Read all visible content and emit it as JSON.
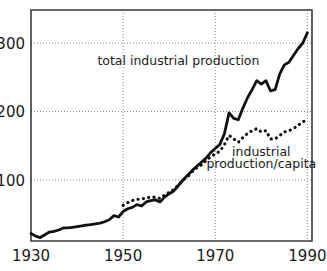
{
  "chart_data": {
    "type": "line",
    "title": "",
    "subtitle": "",
    "xlabel": "",
    "ylabel": "",
    "xlim": [
      1930,
      1991
    ],
    "ylim": [
      0,
      330
    ],
    "grid": true,
    "grid_style": "dotted",
    "legend": "inline-annotations",
    "legend_position": "in-plot",
    "x_ticks": [
      "1930",
      "1950",
      "1970",
      "1990"
    ],
    "x_tick_values": [
      1930,
      1950,
      1970,
      1990
    ],
    "y_ticks": [
      "100",
      "200",
      "300"
    ],
    "y_tick_values": [
      100,
      200,
      300
    ],
    "annotations": [
      {
        "id": "total-label",
        "text": "total industrial production",
        "x": 1962,
        "y": 268
      },
      {
        "id": "percapita-label-line1",
        "text": "industrial",
        "x": 1980,
        "y": 135
      },
      {
        "id": "percapita-label-line2",
        "text": "production/capita",
        "x": 1980,
        "y": 117
      }
    ],
    "series": [
      {
        "name": "total industrial production",
        "style": "solid",
        "x": [
          1930,
          1931,
          1932,
          1933,
          1934,
          1935,
          1936,
          1937,
          1938,
          1939,
          1940,
          1941,
          1942,
          1943,
          1944,
          1945,
          1946,
          1947,
          1948,
          1949,
          1950,
          1951,
          1952,
          1953,
          1954,
          1955,
          1956,
          1957,
          1958,
          1959,
          1960,
          1961,
          1962,
          1963,
          1964,
          1965,
          1966,
          1967,
          1968,
          1969,
          1970,
          1971,
          1972,
          1973,
          1974,
          1975,
          1976,
          1977,
          1978,
          1979,
          1980,
          1981,
          1982,
          1983,
          1984,
          1985,
          1986,
          1987,
          1988,
          1989,
          1990
        ],
        "values": [
          22,
          18,
          16,
          20,
          24,
          25,
          27,
          30,
          30,
          31,
          32,
          33,
          34,
          35,
          36,
          37,
          39,
          42,
          48,
          46,
          54,
          58,
          60,
          64,
          62,
          68,
          70,
          71,
          68,
          75,
          80,
          84,
          92,
          100,
          107,
          114,
          120,
          126,
          132,
          140,
          146,
          152,
          168,
          198,
          190,
          188,
          205,
          220,
          232,
          245,
          240,
          245,
          230,
          232,
          255,
          268,
          272,
          282,
          292,
          300,
          315
        ]
      },
      {
        "name": "industrial production/capita",
        "style": "dotted",
        "x": [
          1950,
          1951,
          1952,
          1953,
          1954,
          1955,
          1956,
          1957,
          1958,
          1959,
          1960,
          1961,
          1962,
          1963,
          1964,
          1965,
          1966,
          1967,
          1968,
          1969,
          1970,
          1971,
          1972,
          1973,
          1974,
          1975,
          1976,
          1977,
          1978,
          1979,
          1980,
          1981,
          1982,
          1983,
          1984,
          1985,
          1986,
          1987,
          1988,
          1989,
          1990
        ],
        "values": [
          63,
          67,
          70,
          72,
          72,
          74,
          75,
          75,
          73,
          78,
          82,
          86,
          93,
          100,
          105,
          112,
          118,
          122,
          128,
          134,
          138,
          142,
          152,
          165,
          160,
          155,
          162,
          168,
          172,
          175,
          170,
          172,
          160,
          160,
          165,
          170,
          172,
          175,
          180,
          185,
          188
        ]
      }
    ]
  },
  "figure": {
    "border": "plot-frame",
    "background_color": "#ffffff",
    "ink_color": "#111111"
  }
}
